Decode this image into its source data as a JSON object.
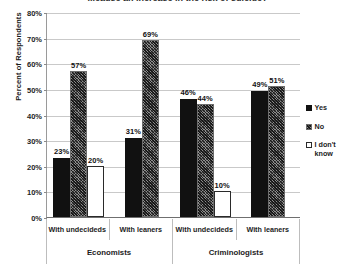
{
  "chart_data": {
    "type": "bar",
    "title": "...cause an increase in the risk of suicide?",
    "xlabel": "",
    "ylabel": "Percent of Respondents",
    "ylim": [
      0,
      80
    ],
    "ytick_labels": [
      "80%",
      "70%",
      "60%",
      "50%",
      "40%",
      "30%",
      "20%",
      "10%",
      "0%"
    ],
    "ytick_values": [
      80,
      70,
      60,
      50,
      40,
      30,
      20,
      10,
      0
    ],
    "grid": true,
    "legend_position": "right",
    "categories": [
      "With undecideds",
      "With leaners",
      "With undecideds",
      "With leaners"
    ],
    "supercategories": [
      "Economists",
      "Criminologists"
    ],
    "series": [
      {
        "name": "Yes",
        "values": [
          23,
          31,
          46,
          49
        ]
      },
      {
        "name": "No",
        "values": [
          57,
          69,
          44,
          51
        ]
      },
      {
        "name": "I don't know",
        "values": [
          20,
          null,
          10,
          null
        ]
      }
    ],
    "groups": [
      {
        "supercategory": "Economists",
        "category": "With undecideds",
        "bars": [
          {
            "series": "Yes",
            "value": 23,
            "label": "23%"
          },
          {
            "series": "No",
            "value": 57,
            "label": "57%"
          },
          {
            "series": "I don't know",
            "value": 20,
            "label": "20%"
          }
        ]
      },
      {
        "supercategory": "Economists",
        "category": "With leaners",
        "bars": [
          {
            "series": "Yes",
            "value": 31,
            "label": "31%"
          },
          {
            "series": "No",
            "value": 69,
            "label": "69%"
          }
        ]
      },
      {
        "supercategory": "Criminologists",
        "category": "With undecideds",
        "bars": [
          {
            "series": "Yes",
            "value": 46,
            "label": "46%"
          },
          {
            "series": "No",
            "value": 44,
            "label": "44%"
          },
          {
            "series": "I don't know",
            "value": 10,
            "label": "10%"
          }
        ]
      },
      {
        "supercategory": "Criminologists",
        "category": "With leaners",
        "bars": [
          {
            "series": "Yes",
            "value": 49,
            "label": "49%"
          },
          {
            "series": "No",
            "value": 51,
            "label": "51%"
          }
        ]
      }
    ],
    "legend": [
      {
        "label": "Yes",
        "swatch": "yes",
        "color": "#111111"
      },
      {
        "label": "No",
        "swatch": "no",
        "color": "#8d8d8d"
      },
      {
        "label": "I don't know",
        "swatch": "idk",
        "color": "#ffffff"
      }
    ]
  }
}
